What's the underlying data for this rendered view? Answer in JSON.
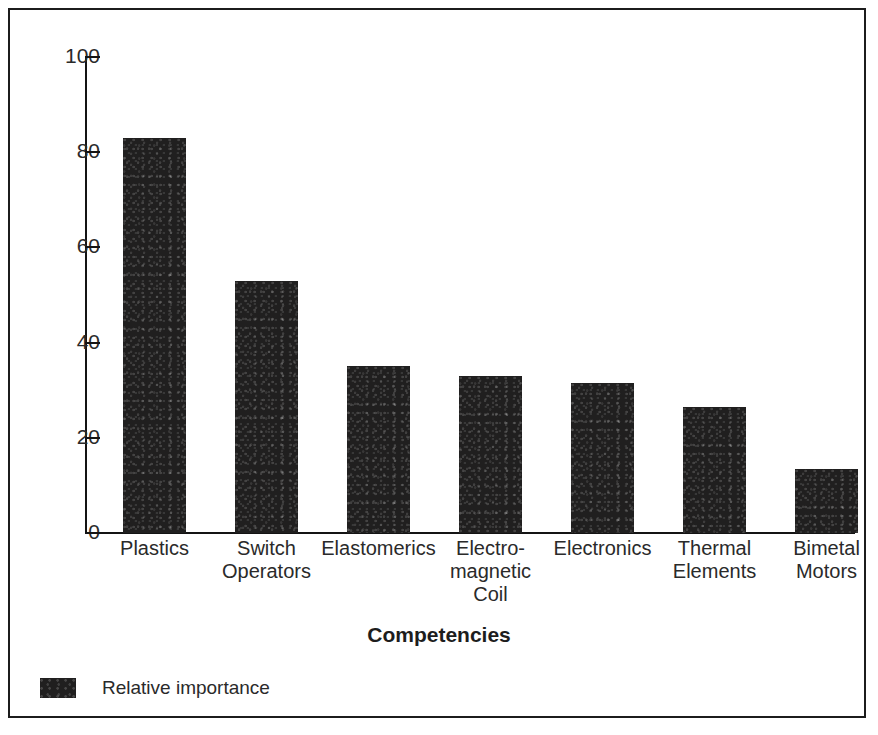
{
  "figure": {
    "cut_off_title_partial": "",
    "legend_position": "bottom-left",
    "frame": "rectangular border"
  },
  "chart_data": {
    "type": "bar",
    "title": "",
    "xlabel": "Competencies",
    "ylabel": "",
    "ylim": [
      0,
      100
    ],
    "yticks": [
      0,
      20,
      40,
      60,
      80,
      100
    ],
    "grid": false,
    "legend": [
      "Relative importance"
    ],
    "series_color": "#201f1f",
    "categories": [
      "Plastics",
      "Switch Operators",
      "Elastomerics",
      "Electro-magnetic Coil",
      "Electronics",
      "Thermal Elements",
      "Bimetal Motors"
    ],
    "category_lines": [
      [
        "Plastics"
      ],
      [
        "Switch",
        "Operators"
      ],
      [
        "Elastomerics"
      ],
      [
        "Electro-",
        "magnetic",
        "Coil"
      ],
      [
        "Electronics"
      ],
      [
        "Thermal",
        "Elements"
      ],
      [
        "Bimetal",
        "Motors"
      ]
    ],
    "series": [
      {
        "name": "Relative importance",
        "values": [
          83,
          53,
          35,
          33,
          31.5,
          26.5,
          13.5
        ]
      }
    ]
  },
  "axis": {
    "y_tick_labels": [
      "100",
      "80",
      "60",
      "40",
      "20",
      "0"
    ],
    "x_title": "Competencies"
  },
  "legend": {
    "label": "Relative importance"
  }
}
